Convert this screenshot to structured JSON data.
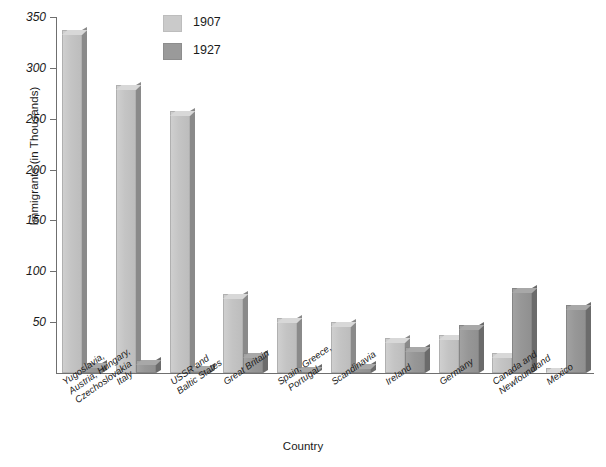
{
  "chart_data": {
    "type": "bar",
    "title": "",
    "xlabel": "Country",
    "ylabel": "Immigrants (in Thousands)",
    "ylim": [
      0,
      350
    ],
    "ytick_step": 50,
    "yticks": [
      50,
      100,
      150,
      200,
      250,
      300,
      350
    ],
    "grid": false,
    "legend_position": "top-center",
    "categories": [
      "Yugoslavia,\nAustria, Hungary,\nCzechoslovakia",
      "Italy",
      "USSR and\nBaltic States",
      "Great Britain",
      "Spain, Greece,\n  Portugal",
      "Scandinavia",
      "Ireland",
      "Germany",
      "Canada and\nNewfoundland",
      "Mexico"
    ],
    "series": [
      {
        "name": "1907",
        "color": "#c8c8c8",
        "values": [
          337,
          283,
          258,
          78,
          54,
          50,
          34,
          37,
          20,
          5
        ]
      },
      {
        "name": "1927",
        "color": "#969696",
        "values": [
          10,
          13,
          7,
          20,
          6,
          9,
          26,
          47,
          84,
          67
        ]
      }
    ]
  },
  "axis": {
    "y_title": "Immigrants (in Thousands)",
    "x_title": "Country",
    "tick_labels": [
      "350",
      "300",
      "250",
      "200",
      "150",
      "100",
      "50"
    ]
  },
  "legend": {
    "items": [
      {
        "label": "1907",
        "swatch": "light-gray"
      },
      {
        "label": "1927",
        "swatch": "dark-gray"
      }
    ]
  }
}
